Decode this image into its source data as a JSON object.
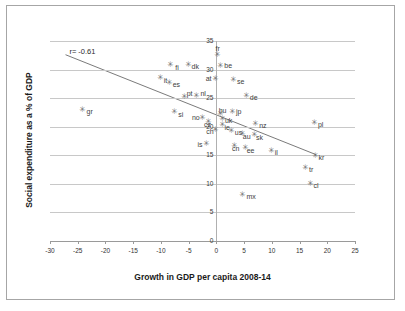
{
  "chart_data": {
    "type": "scatter",
    "title": "",
    "xlabel": "Growth in GDP per capita 2008-14",
    "ylabel": "Social expenditure as a % of GDP",
    "xlim": [
      -30,
      25
    ],
    "ylim": [
      0,
      35
    ],
    "xticks": [
      -30,
      -25,
      -20,
      -15,
      -10,
      -5,
      0,
      5,
      10,
      15,
      20,
      25
    ],
    "yticks": [
      0,
      5,
      10,
      15,
      20,
      25,
      30,
      35
    ],
    "grid": "horizontal",
    "legend": "none",
    "annotations": [
      {
        "text": "r= -0.61",
        "x": -26.5,
        "y": 33.0
      }
    ],
    "trendline": {
      "type": "linear",
      "x_start": -27.2,
      "y_start": 32.6,
      "x_end": 18.0,
      "y_end": 15.1
    },
    "points": [
      {
        "label": "gr",
        "x": -24.3,
        "y": 23.0,
        "label_dx": 5,
        "label_dy": 1
      },
      {
        "label": "it",
        "x": -10.2,
        "y": 28.6,
        "label_dx": 4,
        "label_dy": 2
      },
      {
        "label": "fi",
        "x": -8.3,
        "y": 30.8,
        "label_dx": 5,
        "label_dy": 2
      },
      {
        "label": "es",
        "x": -8.6,
        "y": 27.7,
        "label_dx": 4,
        "label_dy": 1
      },
      {
        "label": "si",
        "x": -7.6,
        "y": 22.6,
        "label_dx": 4,
        "label_dy": 2
      },
      {
        "label": "pt",
        "x": -5.9,
        "y": 25.2,
        "label_dx": 3,
        "label_dy": -4
      },
      {
        "label": "dk",
        "x": -5.2,
        "y": 30.8,
        "label_dx": 4,
        "label_dy": 1
      },
      {
        "label": "nl",
        "x": -3.6,
        "y": 25.3,
        "label_dx": 4,
        "label_dy": -3
      },
      {
        "label": "no",
        "x": -2.6,
        "y": 21.6,
        "label_dx": -10,
        "label_dy": -1
      },
      {
        "label": "cz",
        "x": -1.5,
        "y": 20.9,
        "label_dx": -4,
        "label_dy": 2
      },
      {
        "label": "ch",
        "x": -0.2,
        "y": 19.5,
        "label_dx": -9,
        "label_dy": 1
      },
      {
        "label": "at",
        "x": -0.3,
        "y": 28.4,
        "label_dx": -9,
        "label_dy": -1
      },
      {
        "label": "fr",
        "x": 0.2,
        "y": 32.6,
        "label_dx": -2,
        "label_dy": -7
      },
      {
        "label": "be",
        "x": 0.7,
        "y": 30.6,
        "label_dx": 4,
        "label_dy": -1
      },
      {
        "label": "hu",
        "x": 0.6,
        "y": 22.2,
        "label_dx": -1,
        "label_dy": -4
      },
      {
        "label": "uk",
        "x": 1.0,
        "y": 21.3,
        "label_dx": 3,
        "label_dy": 1
      },
      {
        "label": "ie",
        "x": 1.1,
        "y": 20.3,
        "label_dx": 2,
        "label_dy": 2
      },
      {
        "label": "se",
        "x": 3.0,
        "y": 28.2,
        "label_dx": 4,
        "label_dy": 1
      },
      {
        "label": "jp",
        "x": 2.8,
        "y": 22.6,
        "label_dx": 4,
        "label_dy": -1
      },
      {
        "label": "us",
        "x": 2.6,
        "y": 19.3,
        "label_dx": 4,
        "label_dy": 1
      },
      {
        "label": "cn",
        "x": 3.2,
        "y": 16.6,
        "label_dx": -2,
        "label_dy": 2
      },
      {
        "label": "de",
        "x": 5.3,
        "y": 25.4,
        "label_dx": 4,
        "label_dy": 1
      },
      {
        "label": "au",
        "x": 4.6,
        "y": 18.8,
        "label_dx": 1,
        "label_dy": 2
      },
      {
        "label": "ee",
        "x": 5.1,
        "y": 16.2,
        "label_dx": 2,
        "label_dy": 2
      },
      {
        "label": "mx",
        "x": 4.7,
        "y": 8.1,
        "label_dx": 4,
        "label_dy": 1
      },
      {
        "label": "sk",
        "x": 6.8,
        "y": 18.6,
        "label_dx": 2,
        "label_dy": 2
      },
      {
        "label": "nz",
        "x": 7.0,
        "y": 20.5,
        "label_dx": 4,
        "label_dy": 1
      },
      {
        "label": "is",
        "x": -1.8,
        "y": 16.9,
        "label_dx": -9,
        "label_dy": 0
      },
      {
        "label": "il",
        "x": 9.8,
        "y": 15.8,
        "label_dx": 4,
        "label_dy": 1
      },
      {
        "label": "tr",
        "x": 16.0,
        "y": 12.7,
        "label_dx": 4,
        "label_dy": 1
      },
      {
        "label": "kr",
        "x": 17.7,
        "y": 14.9,
        "label_dx": 4,
        "label_dy": 1
      },
      {
        "label": "cl",
        "x": 16.8,
        "y": 10.0,
        "label_dx": 4,
        "label_dy": 1
      },
      {
        "label": "pl",
        "x": 17.6,
        "y": 20.6,
        "label_dx": 4,
        "label_dy": 1
      }
    ],
    "marker_glyph": "✳"
  },
  "style": {
    "grid_color": "#c8c8c8",
    "axis_color": "#9a9a9a",
    "marker_color": "#6e6e6e",
    "label_color": "#3d3d3d",
    "frame_color": "#a6a6a6"
  }
}
